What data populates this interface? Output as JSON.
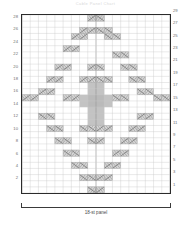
{
  "title": "Cable Panel Chart",
  "caption": "18-st panel",
  "chart_data": {
    "type": "heatmap",
    "title": "Cable Panel Chart",
    "xlabel": "18-st panel",
    "ylabel": "",
    "grid": true,
    "legend": "none",
    "columns": 18,
    "rows": 29,
    "xlim": [
      1,
      18
    ],
    "ylim": [
      1,
      29
    ],
    "row_numbers_left": [
      28,
      26,
      24,
      22,
      20,
      18,
      16,
      14,
      12,
      10,
      8,
      6,
      4,
      2
    ],
    "row_numbers_right": [
      29,
      27,
      25,
      23,
      21,
      19,
      17,
      15,
      13,
      11,
      9,
      7,
      5,
      3,
      1
    ],
    "symbols": {
      "right_cross": "2-stitch right-leaning cable cross",
      "left_cross": "2-stitch left-leaning cable cross",
      "filled": "purl / shaded background stitch"
    },
    "colors": {
      "grid_line": "#c9c9c9",
      "grid_major": "#9a9a9a",
      "frame": "#2b2b2b",
      "cable_fill": "#d5d5d5",
      "cable_stroke": "#8a8a8a",
      "shaded_fill": "#b9b9b9",
      "label": "#6e6e6e"
    },
    "cells": [
      {
        "row": 29,
        "col": 9,
        "type": "right_cross"
      },
      {
        "row": 29,
        "col": 10,
        "type": "left_cross"
      },
      {
        "row": 27,
        "col": 8,
        "type": "right_cross"
      },
      {
        "row": 27,
        "col": 9,
        "type": "right_cross"
      },
      {
        "row": 27,
        "col": 10,
        "type": "left_cross"
      },
      {
        "row": 27,
        "col": 11,
        "type": "left_cross"
      },
      {
        "row": 26,
        "col": 7,
        "type": "right_cross"
      },
      {
        "row": 26,
        "col": 8,
        "type": "right_cross"
      },
      {
        "row": 26,
        "col": 11,
        "type": "left_cross"
      },
      {
        "row": 26,
        "col": 12,
        "type": "left_cross"
      },
      {
        "row": 24,
        "col": 6,
        "type": "right_cross"
      },
      {
        "row": 24,
        "col": 7,
        "type": "right_cross"
      },
      {
        "row": 23,
        "col": 12,
        "type": "left_cross"
      },
      {
        "row": 23,
        "col": 13,
        "type": "left_cross"
      },
      {
        "row": 21,
        "col": 5,
        "type": "right_cross"
      },
      {
        "row": 21,
        "col": 6,
        "type": "right_cross"
      },
      {
        "row": 21,
        "col": 9,
        "type": "right_cross"
      },
      {
        "row": 21,
        "col": 10,
        "type": "left_cross"
      },
      {
        "row": 21,
        "col": 13,
        "type": "left_cross"
      },
      {
        "row": 21,
        "col": 14,
        "type": "left_cross"
      },
      {
        "row": 19,
        "col": 4,
        "type": "right_cross"
      },
      {
        "row": 19,
        "col": 5,
        "type": "right_cross"
      },
      {
        "row": 19,
        "col": 8,
        "type": "right_cross"
      },
      {
        "row": 19,
        "col": 9,
        "type": "right_cross"
      },
      {
        "row": 19,
        "col": 10,
        "type": "left_cross"
      },
      {
        "row": 19,
        "col": 11,
        "type": "left_cross"
      },
      {
        "row": 19,
        "col": 14,
        "type": "left_cross"
      },
      {
        "row": 19,
        "col": 15,
        "type": "left_cross"
      },
      {
        "row": 17,
        "col": 3,
        "type": "right_cross"
      },
      {
        "row": 17,
        "col": 4,
        "type": "right_cross"
      },
      {
        "row": 17,
        "col": 15,
        "type": "left_cross"
      },
      {
        "row": 17,
        "col": 16,
        "type": "left_cross"
      },
      {
        "row": 16,
        "col": 1,
        "type": "right_cross"
      },
      {
        "row": 16,
        "col": 2,
        "type": "right_cross"
      },
      {
        "row": 16,
        "col": 6,
        "type": "right_cross"
      },
      {
        "row": 16,
        "col": 7,
        "type": "right_cross"
      },
      {
        "row": 16,
        "col": 12,
        "type": "left_cross"
      },
      {
        "row": 16,
        "col": 13,
        "type": "left_cross"
      },
      {
        "row": 16,
        "col": 17,
        "type": "left_cross"
      },
      {
        "row": 16,
        "col": 18,
        "type": "left_cross"
      },
      {
        "row": 13,
        "col": 3,
        "type": "left_cross"
      },
      {
        "row": 13,
        "col": 4,
        "type": "left_cross"
      },
      {
        "row": 13,
        "col": 15,
        "type": "right_cross"
      },
      {
        "row": 13,
        "col": 16,
        "type": "right_cross"
      },
      {
        "row": 11,
        "col": 4,
        "type": "left_cross"
      },
      {
        "row": 11,
        "col": 5,
        "type": "left_cross"
      },
      {
        "row": 11,
        "col": 8,
        "type": "left_cross"
      },
      {
        "row": 11,
        "col": 9,
        "type": "left_cross"
      },
      {
        "row": 11,
        "col": 10,
        "type": "right_cross"
      },
      {
        "row": 11,
        "col": 11,
        "type": "right_cross"
      },
      {
        "row": 11,
        "col": 14,
        "type": "right_cross"
      },
      {
        "row": 11,
        "col": 15,
        "type": "right_cross"
      },
      {
        "row": 9,
        "col": 5,
        "type": "left_cross"
      },
      {
        "row": 9,
        "col": 6,
        "type": "left_cross"
      },
      {
        "row": 9,
        "col": 9,
        "type": "left_cross"
      },
      {
        "row": 9,
        "col": 10,
        "type": "right_cross"
      },
      {
        "row": 9,
        "col": 13,
        "type": "right_cross"
      },
      {
        "row": 9,
        "col": 14,
        "type": "right_cross"
      },
      {
        "row": 7,
        "col": 6,
        "type": "left_cross"
      },
      {
        "row": 7,
        "col": 7,
        "type": "left_cross"
      },
      {
        "row": 7,
        "col": 12,
        "type": "right_cross"
      },
      {
        "row": 7,
        "col": 13,
        "type": "right_cross"
      },
      {
        "row": 5,
        "col": 7,
        "type": "left_cross"
      },
      {
        "row": 5,
        "col": 8,
        "type": "left_cross"
      },
      {
        "row": 5,
        "col": 11,
        "type": "right_cross"
      },
      {
        "row": 5,
        "col": 12,
        "type": "right_cross"
      },
      {
        "row": 3,
        "col": 8,
        "type": "left_cross"
      },
      {
        "row": 3,
        "col": 9,
        "type": "left_cross"
      },
      {
        "row": 3,
        "col": 10,
        "type": "right_cross"
      },
      {
        "row": 3,
        "col": 11,
        "type": "right_cross"
      },
      {
        "row": 1,
        "col": 9,
        "type": "left_cross"
      },
      {
        "row": 1,
        "col": 10,
        "type": "right_cross"
      }
    ],
    "shaded_region": {
      "description": "central shaded stitch block",
      "col_start": 9,
      "col_end": 10,
      "row_start": 12,
      "row_end": 19,
      "wide_rows": {
        "row_start": 15,
        "row_end": 16,
        "col_start": 8,
        "col_end": 11
      }
    }
  }
}
